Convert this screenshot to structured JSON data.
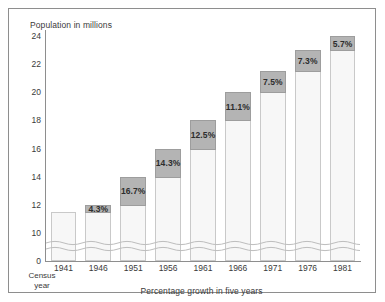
{
  "chart_data": {
    "type": "bar",
    "title": "",
    "ylabel": "Population in millions",
    "xlabel": "Percentage growth in five years",
    "x_axis_corner_label": "Census year",
    "categories": [
      "1941",
      "1946",
      "1951",
      "1956",
      "1961",
      "1966",
      "1971",
      "1976",
      "1981"
    ],
    "values": [
      11.5,
      12.0,
      14.0,
      16.0,
      18.0,
      20.0,
      21.5,
      23.0,
      24.0
    ],
    "bar_segments": [
      {
        "category": "1941",
        "base_top": 11.5,
        "cap_top": 11.5,
        "growth_label": ""
      },
      {
        "category": "1946",
        "base_top": 11.5,
        "cap_top": 12.0,
        "growth_label": "4.3%"
      },
      {
        "category": "1951",
        "base_top": 12.0,
        "cap_top": 14.0,
        "growth_label": "16.7%"
      },
      {
        "category": "1956",
        "base_top": 14.0,
        "cap_top": 16.0,
        "growth_label": "14.3%"
      },
      {
        "category": "1961",
        "base_top": 16.0,
        "cap_top": 18.0,
        "growth_label": "12.5%"
      },
      {
        "category": "1966",
        "base_top": 18.0,
        "cap_top": 20.0,
        "growth_label": "11.1%"
      },
      {
        "category": "1971",
        "base_top": 20.0,
        "cap_top": 21.5,
        "growth_label": "7.5%"
      },
      {
        "category": "1976",
        "base_top": 21.5,
        "cap_top": 23.0,
        "growth_label": "7.3%"
      },
      {
        "category": "1981",
        "base_top": 23.0,
        "cap_top": 24.0,
        "growth_label": "5.7%"
      }
    ],
    "growth_percentages": [
      "",
      "4.3%",
      "16.7%",
      "14.3%",
      "12.5%",
      "11.1%",
      "7.5%",
      "7.3%",
      "5.7%"
    ],
    "yticks": [
      "0",
      "10",
      "12",
      "14",
      "16",
      "18",
      "20",
      "22",
      "24"
    ],
    "ytick_values": [
      0,
      10,
      12,
      14,
      16,
      18,
      20,
      22,
      24
    ],
    "ylim": [
      0,
      24
    ],
    "axis_break": true,
    "axis_break_between": [
      0,
      10
    ],
    "grid": false,
    "legend": false,
    "colors": {
      "bar_body": "#f7f7f7",
      "bar_border": "#c9c9c9",
      "cap_fill": "#b4b4b4",
      "cap_border": "#9d9d9d",
      "axis": "#8e8e8e",
      "text": "#3a3a3a",
      "frame": "#8e8e8e",
      "page_background": "#ffffff"
    }
  }
}
